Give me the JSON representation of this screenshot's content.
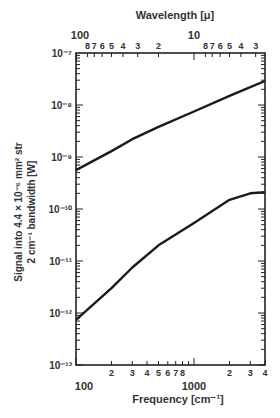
{
  "chart_data": {
    "type": "line",
    "title": "",
    "xlabel": "Frequency [cm⁻¹]",
    "x2label": "Wavelength [μ]",
    "ylabel_line1": "Signal into 4.4 × 10⁻⁶ mm² str",
    "ylabel_line2": "2 cm⁻¹ bandwidth [W]",
    "xscale": "log",
    "yscale": "log",
    "xlim": [
      100,
      4000
    ],
    "ylim": [
      1e-13,
      1e-07
    ],
    "grid": false,
    "x_major_ticks": [
      {
        "value": 100,
        "label": "100"
      },
      {
        "value": 1000,
        "label": "1000"
      }
    ],
    "x_minor_tick_labels": [
      {
        "value": 200,
        "label": "2"
      },
      {
        "value": 300,
        "label": "3"
      },
      {
        "value": 400,
        "label": "4"
      },
      {
        "value": 500,
        "label": "5"
      },
      {
        "value": 600,
        "label": "6"
      },
      {
        "value": 700,
        "label": "7"
      },
      {
        "value": 800,
        "label": "8"
      },
      {
        "value": 2000,
        "label": "2"
      },
      {
        "value": 3000,
        "label": "3"
      },
      {
        "value": 4000,
        "label": "4"
      }
    ],
    "y_ticks": [
      {
        "value": 1e-07,
        "label": "10⁻⁷"
      },
      {
        "value": 1e-08,
        "label": "10⁻⁸"
      },
      {
        "value": 1e-09,
        "label": "10⁻⁹"
      },
      {
        "value": 1e-10,
        "label": "10⁻¹⁰"
      },
      {
        "value": 1e-11,
        "label": "10⁻¹¹"
      },
      {
        "value": 1e-12,
        "label": "10⁻¹²"
      },
      {
        "value": 1e-13,
        "label": "10⁻¹³"
      }
    ],
    "top_axis_labels": [
      {
        "wavelength": 100,
        "label": "100"
      },
      {
        "wavelength": 80,
        "label": "8"
      },
      {
        "wavelength": 70,
        "label": "7"
      },
      {
        "wavelength": 60,
        "label": "6"
      },
      {
        "wavelength": 50,
        "label": "5"
      },
      {
        "wavelength": 40,
        "label": "4"
      },
      {
        "wavelength": 30,
        "label": "3"
      },
      {
        "wavelength": 20,
        "label": "2"
      },
      {
        "wavelength": 10,
        "label": "10"
      },
      {
        "wavelength": 8,
        "label": "8"
      },
      {
        "wavelength": 7,
        "label": "7"
      },
      {
        "wavelength": 6,
        "label": "6"
      },
      {
        "wavelength": 5,
        "label": "5"
      },
      {
        "wavelength": 4,
        "label": "4"
      },
      {
        "wavelength": 3,
        "label": "3"
      }
    ],
    "series": [
      {
        "name": "upper",
        "x": [
          100,
          200,
          300,
          500,
          1000,
          2000,
          3000,
          4000
        ],
        "y": [
          5.6e-10,
          1.3e-09,
          2.2e-09,
          3.8e-09,
          7.5e-09,
          1.5e-08,
          2.2e-08,
          2.9e-08
        ]
      },
      {
        "name": "lower",
        "x": [
          100,
          200,
          300,
          500,
          1000,
          2000,
          3000,
          4000
        ],
        "y": [
          7.4e-13,
          3e-12,
          7.5e-12,
          2e-11,
          5.4e-11,
          1.5e-10,
          2e-10,
          2.1e-10
        ]
      }
    ]
  }
}
